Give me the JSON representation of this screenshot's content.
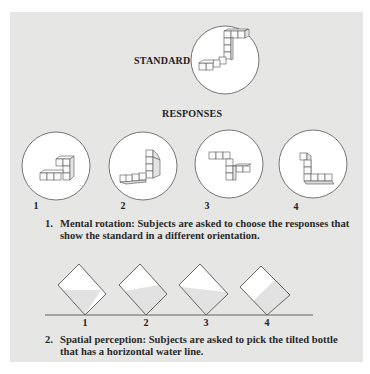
{
  "figure": {
    "standard_label": "STANDARD",
    "responses_label": "RESPONSES",
    "responses": [
      {
        "number": "1"
      },
      {
        "number": "2"
      },
      {
        "number": "3"
      },
      {
        "number": "4"
      }
    ],
    "caption_1": {
      "number": "1.",
      "text": "Mental rotation: Subjects are asked to choose the responses that show the standard in a different orientation."
    },
    "bottles": [
      {
        "number": "1"
      },
      {
        "number": "2"
      },
      {
        "number": "3"
      },
      {
        "number": "4"
      }
    ],
    "caption_2": {
      "number": "2.",
      "text": "Spatial perception: Subjects are asked to pick the tilted bottle that has a horizontal water line."
    },
    "colors": {
      "panel_background": "#e6e6e5",
      "circle_fill": "#ffffff",
      "line": "#555555",
      "water": "#e2e2e2"
    }
  }
}
